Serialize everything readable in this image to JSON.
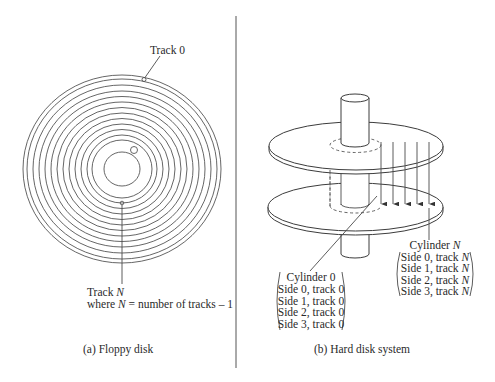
{
  "floppy": {
    "track0_label": "Track 0",
    "trackN_label_prefix": "Track ",
    "trackN_var": "N",
    "where_prefix": "where ",
    "where_var": "N",
    "where_suffix": " = number of tracks – 1",
    "caption": "(a) Floppy disk",
    "ring_count": 14
  },
  "hard_disk": {
    "cylinder0": {
      "title": "Cylinder 0",
      "lines": [
        "Side 0, track 0",
        "Side 1, track 0",
        "Side 2, track 0",
        "Side 3, track 0"
      ]
    },
    "cylinderN": {
      "title_prefix": "Cylinder ",
      "title_var": "N",
      "lines_prefix": [
        "Side 0, track ",
        "Side 1, track ",
        "Side 2, track ",
        "Side 3, track "
      ],
      "lines_var": "N"
    },
    "caption": "(b) Hard disk system"
  },
  "colors": {
    "line": "#4a4a4a",
    "text": "#2a2a2a",
    "background": "#ffffff"
  }
}
